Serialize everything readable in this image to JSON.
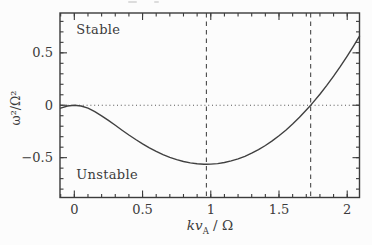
{
  "figure": {
    "background": "#fcfcfc",
    "ink_color": "#3b3b3b",
    "curve_color": "#404040",
    "dashed_color": "#4a4a4a",
    "dotted_color": "#555555"
  },
  "chart_data": {
    "type": "line",
    "title": "",
    "xlabel": "kv_A / Ω",
    "xlabel_parts": {
      "italic": "kv",
      "subscript": "A",
      "rest": " / Ω"
    },
    "ylabel": "ω²/Ω²",
    "xlim": [
      -0.105,
      2.09
    ],
    "ylim": [
      -0.88,
      0.88
    ],
    "x_major_ticks": [
      0,
      0.5,
      1,
      1.5,
      2
    ],
    "x_major_tick_labels": [
      "0",
      "0.5",
      "1",
      "1.5",
      "2"
    ],
    "y_major_ticks": [
      -0.5,
      0,
      0.5
    ],
    "y_major_tick_labels": [
      "−0.5",
      "0",
      "0.5"
    ],
    "minor_tick_step": 0.1,
    "grid": false,
    "legend": null,
    "annotations": [
      {
        "text": "Stable",
        "x": 0.015,
        "y": 0.73
      },
      {
        "text": "Unstable",
        "x": 0.015,
        "y": -0.66
      }
    ],
    "reference_lines": {
      "dotted_horizontal_y": 0,
      "dashed_vertical_x": [
        0.968,
        1.732
      ]
    },
    "series": [
      {
        "name": "dispersion_curve",
        "x": [
          -0.1,
          -0.05,
          0.0,
          0.05,
          0.1,
          0.15,
          0.2,
          0.25,
          0.3,
          0.35,
          0.4,
          0.45,
          0.5,
          0.55,
          0.6,
          0.65,
          0.7,
          0.75,
          0.8,
          0.85,
          0.9,
          0.95,
          0.968,
          1.0,
          1.05,
          1.1,
          1.15,
          1.2,
          1.25,
          1.3,
          1.35,
          1.4,
          1.45,
          1.5,
          1.55,
          1.6,
          1.65,
          1.7,
          1.732,
          1.75,
          1.8,
          1.85,
          1.9,
          1.95,
          2.0,
          2.05,
          2.09
        ],
        "y": [
          -0.0285,
          -0.0074,
          0.0,
          -0.0074,
          -0.0285,
          -0.0606,
          -0.1003,
          -0.1446,
          -0.191,
          -0.2377,
          -0.2834,
          -0.3271,
          -0.368,
          -0.4058,
          -0.44,
          -0.4703,
          -0.4966,
          -0.5186,
          -0.5363,
          -0.5495,
          -0.5581,
          -0.5622,
          -0.5625,
          -0.5616,
          -0.5562,
          -0.5461,
          -0.5312,
          -0.5115,
          -0.487,
          -0.4576,
          -0.4234,
          -0.3843,
          -0.3403,
          -0.2914,
          -0.2376,
          -0.1788,
          -0.1152,
          -0.0466,
          0.0,
          0.027,
          0.1054,
          0.1889,
          0.2773,
          0.3706,
          0.4689,
          0.5721,
          0.6583
        ]
      }
    ]
  }
}
